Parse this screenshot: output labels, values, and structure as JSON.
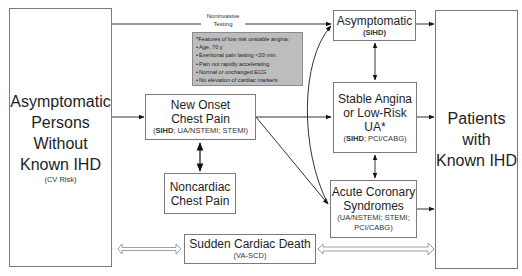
{
  "boxes": {
    "asymptomatic_persons": {
      "title": "Asymptomatic Persons Without Known IHD",
      "lines": [
        "Asymptomatic",
        "Persons",
        "Without",
        "Known IHD"
      ],
      "sub": "(CV Risk)"
    },
    "new_onset": {
      "lines": [
        "New Onset",
        "Chest Pain"
      ],
      "sub_bold": "SIHD",
      "sub_rest": "; UA/NSTEMI; STEMI)"
    },
    "noncardiac": {
      "lines": [
        "Noncardiac",
        "Chest Pain"
      ]
    },
    "sudden_death": {
      "title": "Sudden Cardiac Death",
      "sub": "(VA-SCD)"
    },
    "asymptomatic_sihd": {
      "title": "Asymptomatic",
      "sub": "(SIHD)"
    },
    "stable_angina": {
      "lines": [
        "Stable Angina",
        "or Low-Risk",
        "UA*"
      ],
      "sub_bold": "SIHD",
      "sub_rest": "; PCI/CABG)"
    },
    "acs": {
      "lines": [
        "Acute Coronary",
        "Syndromes"
      ],
      "sub1": "(UA/NSTEMI; STEMI;",
      "sub2": "PCI/CABG)"
    },
    "patients_known": {
      "lines": [
        "Patients",
        "with",
        "Known IHD"
      ]
    }
  },
  "edge_labels": {
    "noninvasive_1": "Noninvasive",
    "noninvasive_2": "Testing"
  },
  "note": {
    "title": "*Features of low risk unstable angina:",
    "items": [
      "Age, 70 y",
      "Exertional pain lasting <20 min.",
      "Pain not rapidly accelerating",
      "Normal or unchanged ECG",
      "No elevation of cardiac markers"
    ]
  }
}
